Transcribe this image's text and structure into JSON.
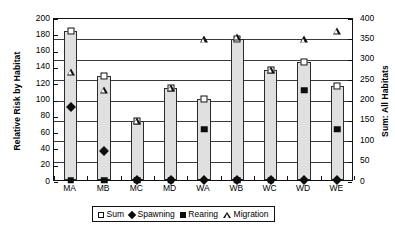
{
  "chart_data": {
    "type": "bar",
    "title": "",
    "xlabel": "",
    "ylabel": "Relative Risk by Habitat",
    "y2label": "Sum: All Habitats",
    "categories": [
      "MA",
      "MB",
      "MC",
      "MD",
      "WA",
      "WB",
      "WC",
      "WD",
      "WE"
    ],
    "ylim": [
      0,
      200
    ],
    "y2lim": [
      0,
      400
    ],
    "yticks": [
      0,
      20,
      40,
      60,
      80,
      100,
      120,
      140,
      160,
      180,
      200
    ],
    "y2ticks": [
      0,
      50,
      100,
      150,
      200,
      250,
      300,
      350,
      400
    ],
    "grid": true,
    "legend_position": "bottom",
    "series": [
      {
        "name": "Sum",
        "marker": "open-square",
        "render": "bar",
        "axis": "right",
        "values": [
          365,
          255,
          145,
          225,
          200,
          345,
          270,
          290,
          230
        ]
      },
      {
        "name": "Spawning",
        "marker": "filled-diamond",
        "render": "marker",
        "axis": "left",
        "values": [
          90,
          36,
          0,
          0,
          0,
          0,
          0,
          0,
          0
        ]
      },
      {
        "name": "Rearing",
        "marker": "filled-square",
        "render": "marker",
        "axis": "left",
        "values": [
          0,
          0,
          0,
          0,
          62,
          0,
          0,
          110,
          62
        ]
      },
      {
        "name": "Migration",
        "marker": "open-triangle",
        "render": "marker",
        "axis": "right",
        "values": [
          265,
          220,
          145,
          225,
          345,
          350,
          270,
          345,
          365
        ]
      }
    ]
  },
  "axes": {
    "left": {
      "title": "Relative Risk by Habitat",
      "tick_labels": [
        "200",
        "180",
        "160",
        "140",
        "120",
        "100",
        "80",
        "60",
        "40",
        "20",
        "0"
      ]
    },
    "right": {
      "title": "Sum: All Habitats",
      "tick_labels": [
        "400",
        "350",
        "300",
        "250",
        "200",
        "150",
        "100",
        "50",
        "0"
      ]
    },
    "bottom": {
      "tick_labels": [
        "MA",
        "MB",
        "MC",
        "MD",
        "WA",
        "WB",
        "WC",
        "WD",
        "WE"
      ]
    }
  },
  "legend": {
    "items": [
      {
        "label": "Sum",
        "icon": "open-square-icon"
      },
      {
        "label": "Spawning",
        "icon": "filled-diamond-icon"
      },
      {
        "label": "Rearing",
        "icon": "filled-square-icon"
      },
      {
        "label": "Migration",
        "icon": "open-triangle-icon"
      }
    ]
  },
  "colors": {
    "bar_fill": "#e0e0e0",
    "bar_stroke": "#2b2b2b",
    "marker": "#0d0d0d",
    "grid": "#3a3a3a",
    "axis": "#111111",
    "background": "#ffffff"
  }
}
